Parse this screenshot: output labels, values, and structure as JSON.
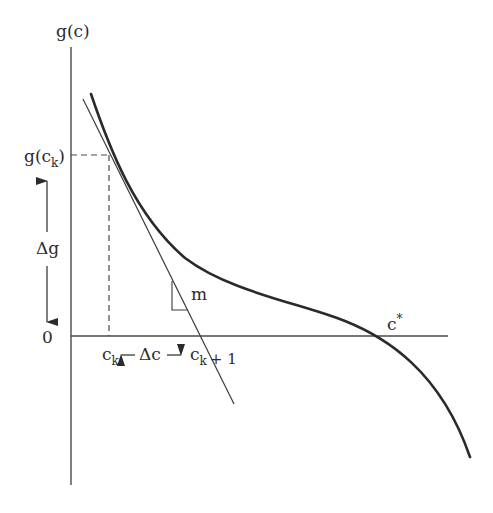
{
  "diagram": {
    "axes": {
      "y_label": "g(c)",
      "x_origin_label": "0"
    },
    "labels": {
      "g_ck_main": "g(c",
      "g_ck_sub": "k",
      "g_ck_close": ")",
      "delta_g": "Δg",
      "ck_main": "c",
      "ck_sub": "k",
      "delta_c": "Δc",
      "ck1_main": "c",
      "ck1_sub": "k",
      "ck1_plus": "+ 1",
      "slope": "m",
      "root_main": "c",
      "root_star": "*"
    },
    "colors": {
      "curve": "#2a2a2a",
      "axis": "#4a4a4a",
      "tangent": "#3a3a3a",
      "dashed": "#4a4a4a",
      "text": "#2b2b2b"
    }
  }
}
